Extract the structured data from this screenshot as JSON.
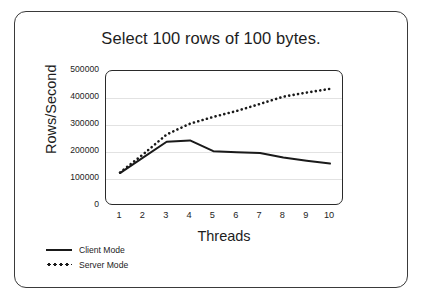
{
  "chart_data": {
    "type": "line",
    "title": "Select 100 rows of 100 bytes.",
    "xlabel": "Threads",
    "ylabel": "Rows/Second",
    "x": [
      1,
      2,
      3,
      4,
      5,
      6,
      7,
      8,
      9,
      10
    ],
    "xtick_labels": [
      "1",
      "2",
      "3",
      "4",
      "5",
      "6",
      "7",
      "8",
      "9",
      "10"
    ],
    "ytick_labels": [
      "500000",
      "400000",
      "300000",
      "200000",
      "100000",
      "0"
    ],
    "ytick_values": [
      500000,
      400000,
      300000,
      200000,
      100000,
      0
    ],
    "xlim": [
      1,
      10
    ],
    "ylim": [
      0,
      500000
    ],
    "grid": "horizontal",
    "legend_position": "below-left",
    "series": [
      {
        "name": "Client Mode",
        "style": "solid",
        "color": "#1a1a1a",
        "values": [
          122000,
          180000,
          238000,
          243000,
          203000,
          199000,
          196000,
          180000,
          168000,
          157000
        ]
      },
      {
        "name": "Server Mode",
        "style": "dotted",
        "color": "#1a1a1a",
        "values": [
          124000,
          192000,
          265000,
          305000,
          330000,
          352000,
          378000,
          405000,
          420000,
          434000
        ]
      }
    ]
  },
  "legend": {
    "entries": [
      {
        "label": "Client Mode",
        "key": "solid-line-key"
      },
      {
        "label": "Server Mode",
        "key": "dotted-line-key"
      }
    ]
  },
  "colors": {
    "border": "#3a3a3a",
    "axis": "#2a2a2a",
    "grid": "#e2e2e2",
    "text": "#1d1d1d",
    "background": "#ffffff"
  }
}
